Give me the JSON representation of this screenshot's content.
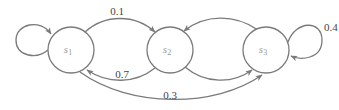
{
  "diagram": {
    "type": "markov-chain",
    "colors": {
      "stroke": "#7a7a7a",
      "node_label": "#9a9a9a",
      "edge_label": "#444444",
      "background": "#ffffff"
    },
    "nodes": [
      {
        "id": "s1",
        "label_base": "s",
        "label_sub": "1"
      },
      {
        "id": "s2",
        "label_base": "s",
        "label_sub": "2"
      },
      {
        "id": "s3",
        "label_base": "s",
        "label_sub": "3"
      }
    ],
    "edges": [
      {
        "from": "s1",
        "to": "s1",
        "label": ""
      },
      {
        "from": "s1",
        "to": "s2",
        "label": "0.1"
      },
      {
        "from": "s2",
        "to": "s1",
        "label": "0.7"
      },
      {
        "from": "s1",
        "to": "s3",
        "label": "0.3"
      },
      {
        "from": "s2",
        "to": "s3",
        "label": ""
      },
      {
        "from": "s3",
        "to": "s2",
        "label": ""
      },
      {
        "from": "s3",
        "to": "s3",
        "label": "0.4"
      }
    ]
  }
}
